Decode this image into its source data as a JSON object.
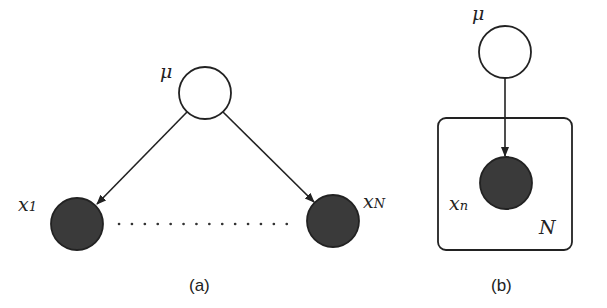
{
  "panels": [
    {
      "caption": "(a)",
      "nodes": [
        {
          "id": "mu",
          "label": "μ",
          "observed": false
        },
        {
          "id": "x1",
          "label": "x",
          "subscript": "1",
          "observed": true
        },
        {
          "id": "xN",
          "label": "x",
          "subscript": "N",
          "observed": true
        }
      ],
      "edges": [
        [
          "mu",
          "x1"
        ],
        [
          "mu",
          "xN"
        ]
      ],
      "ellipsis": "dotted line between x1 and xN"
    },
    {
      "caption": "(b)",
      "nodes": [
        {
          "id": "mu",
          "label": "μ",
          "observed": false
        },
        {
          "id": "xn",
          "label": "x",
          "subscript": "n",
          "observed": true
        }
      ],
      "edges": [
        [
          "mu",
          "xn"
        ]
      ],
      "plate": {
        "label": "N",
        "contains": [
          "xn"
        ]
      }
    }
  ],
  "colors": {
    "observed_fill": "#3a3a3a",
    "stroke": "#222222",
    "background": "#ffffff"
  }
}
